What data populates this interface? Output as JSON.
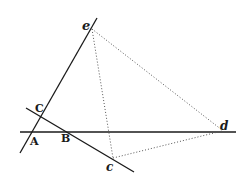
{
  "diagram": {
    "type": "geometric-construction",
    "colors": {
      "line": "#1a1a1a",
      "dotted": "#555555",
      "background": "#ffffff"
    },
    "points": {
      "e": {
        "label": "e",
        "x": 92,
        "y": 28
      },
      "C": {
        "label": "C",
        "x": 39,
        "y": 116
      },
      "A": {
        "label": "A",
        "x": 31,
        "y": 132
      },
      "B": {
        "label": "B",
        "x": 66,
        "y": 132
      },
      "d": {
        "label": "d",
        "x": 222,
        "y": 131
      },
      "c": {
        "label": "c",
        "x": 113,
        "y": 158
      }
    },
    "solid_lines": [
      {
        "name": "line-through-e-and-C",
        "x1": 97,
        "y1": 18,
        "x2": 20,
        "y2": 153
      },
      {
        "name": "horizontal-line-AB-d",
        "x1": 20,
        "y1": 132,
        "x2": 236,
        "y2": 132
      },
      {
        "name": "diagonal-line-C-B-c",
        "x1": 26,
        "y1": 108,
        "x2": 134,
        "y2": 172
      }
    ],
    "dotted_lines": [
      {
        "name": "dotted-e-to-d",
        "x1": 92,
        "y1": 29,
        "x2": 222,
        "y2": 130
      },
      {
        "name": "dotted-e-to-c",
        "x1": 92,
        "y1": 29,
        "x2": 113,
        "y2": 158
      },
      {
        "name": "dotted-c-to-d",
        "x1": 113,
        "y1": 158,
        "x2": 222,
        "y2": 131
      }
    ],
    "labels": [
      {
        "name": "label-e",
        "text": "e",
        "x": 82,
        "y": 30,
        "size": 13,
        "italic": true
      },
      {
        "name": "label-C",
        "text": "C",
        "x": 35,
        "y": 112,
        "size": 11,
        "italic": false
      },
      {
        "name": "label-A",
        "text": "A",
        "x": 30,
        "y": 145,
        "size": 11,
        "italic": false
      },
      {
        "name": "label-B",
        "text": "B",
        "x": 61,
        "y": 142,
        "size": 11,
        "italic": false
      },
      {
        "name": "label-d",
        "text": "d",
        "x": 220,
        "y": 130,
        "size": 12,
        "italic": true
      },
      {
        "name": "label-c",
        "text": "c",
        "x": 106,
        "y": 171,
        "size": 12,
        "italic": true
      }
    ]
  }
}
